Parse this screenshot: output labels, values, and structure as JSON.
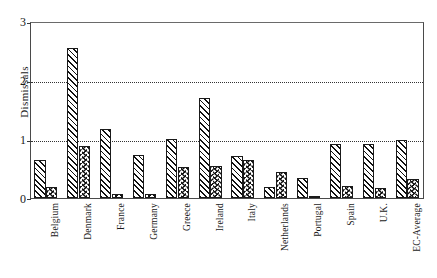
{
  "chart_data": {
    "type": "bar",
    "title": "",
    "subtitle": "",
    "xlabel": "",
    "ylabel": "Dismissals",
    "ylim": [
      0,
      3
    ],
    "yticks": [
      "0",
      "1",
      "2",
      "3"
    ],
    "ytick_values": [
      0,
      1,
      2,
      3
    ],
    "grid": "horizontal dotted gridlines at y = 1 and y = 2",
    "legend": "none",
    "legend_position": "none",
    "categories": [
      "Belgium",
      "Denmark",
      "France",
      "Germany",
      "Greece",
      "Ireland",
      "Italy",
      "Netherlands",
      "Portugal",
      "Spain",
      "U.K.",
      "EC-Average"
    ],
    "series": [
      {
        "name": "Series 1",
        "pattern": "diagonal-hatch",
        "values": [
          0.65,
          2.55,
          1.17,
          0.73,
          1.0,
          1.7,
          0.71,
          0.18,
          0.34,
          0.91,
          0.92,
          0.99
        ]
      },
      {
        "name": "Series 2",
        "pattern": "chevron-hatch",
        "values": [
          0.18,
          0.88,
          0.07,
          0.06,
          0.52,
          0.54,
          0.65,
          0.44,
          0.02,
          0.2,
          0.17,
          0.33
        ]
      }
    ]
  },
  "axis": {
    "y_title": "Dismissals",
    "y_tick_labels": [
      "3",
      "2",
      "1",
      "0"
    ]
  },
  "colors": {
    "ink": "#111111",
    "frame": "#4a4a4a",
    "background": "#ffffff"
  }
}
